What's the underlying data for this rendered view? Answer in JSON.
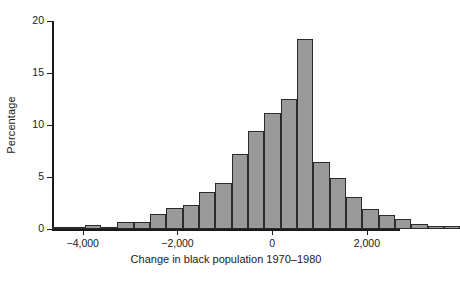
{
  "chart_data": {
    "type": "bar",
    "title": "",
    "subtitle": "",
    "xlabel": "Change in black population 1970–1980",
    "ylabel": "Percentage",
    "xlim": [
      -4650,
      2700
    ],
    "ylim": [
      0,
      20
    ],
    "xticks": [
      -4000,
      -2000,
      0,
      2000
    ],
    "xtick_labels": [
      "−4,000",
      "−2,000",
      "0",
      "2,000"
    ],
    "yticks": [
      0,
      5,
      10,
      15,
      20
    ],
    "ytick_labels": [
      "0",
      "5",
      "10",
      "15",
      "20"
    ],
    "grid": false,
    "legend": false,
    "bin_width": 345,
    "bar_color": "#9a9a9a",
    "bar_edge_color": "#2b2b2b",
    "axis_color": "#1a1a1a",
    "background_color": "#ffffff",
    "bins": [
      {
        "x_left": -4650,
        "x_right": -4305,
        "center": -4478,
        "value": 0.15
      },
      {
        "x_left": -4305,
        "x_right": -3960,
        "center": -4133,
        "value": 0.1
      },
      {
        "x_left": -3960,
        "x_right": -3615,
        "center": -3788,
        "value": 0.35
      },
      {
        "x_left": -3615,
        "x_right": -3270,
        "center": -3443,
        "value": 0.1
      },
      {
        "x_left": -3270,
        "x_right": -2925,
        "center": -3098,
        "value": 0.7
      },
      {
        "x_left": -2925,
        "x_right": -2580,
        "center": -2753,
        "value": 0.7
      },
      {
        "x_left": -2580,
        "x_right": -2235,
        "center": -2408,
        "value": 1.4
      },
      {
        "x_left": -2235,
        "x_right": -1890,
        "center": -2063,
        "value": 2.0
      },
      {
        "x_left": -1890,
        "x_right": -1545,
        "center": -1718,
        "value": 2.3
      },
      {
        "x_left": -1545,
        "x_right": -1200,
        "center": -1373,
        "value": 3.6
      },
      {
        "x_left": -1200,
        "x_right": -855,
        "center": -1028,
        "value": 4.4
      },
      {
        "x_left": -855,
        "x_right": -510,
        "center": -683,
        "value": 7.2
      },
      {
        "x_left": -510,
        "x_right": -165,
        "center": -338,
        "value": 9.4
      },
      {
        "x_left": -165,
        "x_right": 180,
        "center": 8,
        "value": 11.2
      },
      {
        "x_left": 180,
        "x_right": 525,
        "center": 353,
        "value": 12.5
      },
      {
        "x_left": 525,
        "x_right": 870,
        "center": 698,
        "value": 18.3
      },
      {
        "x_left": 870,
        "x_right": 1215,
        "center": 1043,
        "value": 6.4
      },
      {
        "x_left": 1215,
        "x_right": 1560,
        "center": 1388,
        "value": 4.9
      },
      {
        "x_left": 1560,
        "x_right": 1905,
        "center": 1733,
        "value": 3.1
      },
      {
        "x_left": 1905,
        "x_right": 2250,
        "center": 2078,
        "value": 1.9
      },
      {
        "x_left": 2250,
        "x_right": 2595,
        "center": 2423,
        "value": 1.35
      },
      {
        "x_left": 2595,
        "x_right": 2940,
        "center": 2768,
        "value": 0.95
      },
      {
        "x_left": 2940,
        "x_right": 3285,
        "center": 3113,
        "value": 0.5
      },
      {
        "x_left": 3285,
        "x_right": 3630,
        "center": 3458,
        "value": 0.25
      },
      {
        "x_left": 3630,
        "x_right": 3975,
        "center": 3803,
        "value": 0.25
      }
    ],
    "values": [
      0.15,
      0.1,
      0.35,
      0.1,
      0.7,
      0.7,
      1.4,
      2.0,
      2.3,
      3.6,
      4.4,
      7.2,
      9.4,
      11.2,
      12.5,
      18.3,
      6.4,
      4.9,
      3.1,
      1.9,
      1.35,
      0.95,
      0.5,
      0.25,
      0.25
    ],
    "categories": [
      "-4478",
      "-4133",
      "-3788",
      "-3443",
      "-3098",
      "-2753",
      "-2408",
      "-2063",
      "-1718",
      "-1373",
      "-1028",
      "-683",
      "-338",
      "8",
      "353",
      "698",
      "1043",
      "1388",
      "1733",
      "2078",
      "2423",
      "2768",
      "3113",
      "3458",
      "3803"
    ]
  }
}
